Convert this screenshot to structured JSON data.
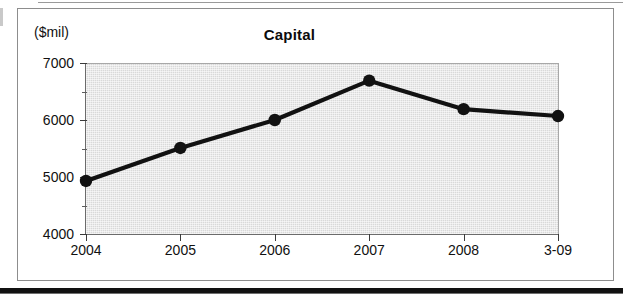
{
  "figure": {
    "title": "Capital",
    "y_unit_label": "($mil)"
  },
  "chart_data": {
    "type": "line",
    "title": "Capital",
    "xlabel": "",
    "ylabel": "($mil)",
    "categories": [
      "2004",
      "2005",
      "2006",
      "2007",
      "2008",
      "3-09"
    ],
    "values": [
      4930,
      5510,
      6000,
      6690,
      6190,
      6070
    ],
    "series": [
      {
        "name": "Capital",
        "values": [
          4930,
          5510,
          6000,
          6690,
          6190,
          6070
        ]
      }
    ],
    "ylim": [
      4000,
      7000
    ],
    "ytick_labels": [
      "4000",
      "5000",
      "6000",
      "7000"
    ],
    "ytick_values": [
      4000,
      5000,
      6000,
      7000
    ],
    "yminor_tick_values": [
      4500,
      5500,
      6500
    ],
    "grid": false,
    "legend": null,
    "marker": "filled-circle",
    "line_color": "#111111",
    "plot_background_color": "#d9d9d9"
  },
  "colors": {
    "line": "#111111",
    "marker": "#111111",
    "plot_bg": "#d9d9d9",
    "axis": "#3a3a3a",
    "frame": "#8d8d8d",
    "text": "#111111"
  }
}
